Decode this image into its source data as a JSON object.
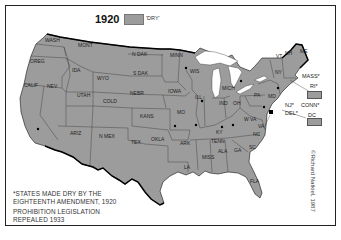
{
  "map": {
    "title": "1920",
    "legend": {
      "label": "'DRY'",
      "color": "#9c9c9c"
    },
    "land_color": "#9c9c9c",
    "water_color": "#ffffff",
    "states": [
      {
        "abbr": "WASH",
        "x": 45,
        "y": 42
      },
      {
        "abbr": "OREG",
        "x": 30,
        "y": 63
      },
      {
        "abbr": "CALIF",
        "x": 24,
        "y": 87
      },
      {
        "abbr": "NEV",
        "x": 47,
        "y": 88
      },
      {
        "abbr": "IDA",
        "x": 72,
        "y": 72
      },
      {
        "abbr": "MONT",
        "x": 78,
        "y": 47
      },
      {
        "abbr": "WYO",
        "x": 97,
        "y": 80
      },
      {
        "abbr": "UTAH",
        "x": 77,
        "y": 97
      },
      {
        "abbr": "COLD",
        "x": 103,
        "y": 103
      },
      {
        "abbr": "ARIZ",
        "x": 70,
        "y": 135
      },
      {
        "abbr": "N MEX",
        "x": 99,
        "y": 138
      },
      {
        "abbr": "N DAK",
        "x": 132,
        "y": 56
      },
      {
        "abbr": "S DAK",
        "x": 133,
        "y": 75
      },
      {
        "abbr": "NEBR",
        "x": 130,
        "y": 95
      },
      {
        "abbr": "KANS",
        "x": 140,
        "y": 118
      },
      {
        "abbr": "OKLA",
        "x": 151,
        "y": 141
      },
      {
        "abbr": "TEX",
        "x": 131,
        "y": 144
      },
      {
        "abbr": "MINN",
        "x": 170,
        "y": 57
      },
      {
        "abbr": "IOWA",
        "x": 168,
        "y": 93
      },
      {
        "abbr": "MO",
        "x": 177,
        "y": 114
      },
      {
        "abbr": "ARK",
        "x": 180,
        "y": 145
      },
      {
        "abbr": "LA",
        "x": 184,
        "y": 169
      },
      {
        "abbr": "WIS",
        "x": 190,
        "y": 73
      },
      {
        "abbr": "ILL",
        "x": 195,
        "y": 99
      },
      {
        "abbr": "MICH",
        "x": 222,
        "y": 90
      },
      {
        "abbr": "IND",
        "x": 219,
        "y": 105
      },
      {
        "abbr": "OH",
        "x": 233,
        "y": 105
      },
      {
        "abbr": "KY",
        "x": 216,
        "y": 134
      },
      {
        "abbr": "TENN",
        "x": 211,
        "y": 143
      },
      {
        "abbr": "MISS",
        "x": 202,
        "y": 159
      },
      {
        "abbr": "ALA",
        "x": 218,
        "y": 153
      },
      {
        "abbr": "GA",
        "x": 234,
        "y": 152
      },
      {
        "abbr": "FLA",
        "x": 250,
        "y": 183
      },
      {
        "abbr": "SC",
        "x": 249,
        "y": 149
      },
      {
        "abbr": "NC",
        "x": 253,
        "y": 136
      },
      {
        "abbr": "VA",
        "x": 258,
        "y": 128
      },
      {
        "abbr": "W VA",
        "x": 244,
        "y": 121
      },
      {
        "abbr": "PA",
        "x": 254,
        "y": 97
      },
      {
        "abbr": "MD",
        "x": 268,
        "y": 98
      },
      {
        "abbr": "NY",
        "x": 275,
        "y": 74
      },
      {
        "abbr": "ME",
        "x": 300,
        "y": 53
      },
      {
        "abbr": "VT",
        "x": 276,
        "y": 58
      },
      {
        "abbr": "NH",
        "x": 285,
        "y": 55
      }
    ],
    "dry_markers": [
      {
        "x": 38,
        "y": 129
      },
      {
        "x": 186,
        "y": 68
      },
      {
        "x": 202,
        "y": 101
      },
      {
        "x": 196,
        "y": 125
      },
      {
        "x": 175,
        "y": 126
      },
      {
        "x": 222,
        "y": 127
      },
      {
        "x": 241,
        "y": 81
      },
      {
        "x": 278,
        "y": 88
      },
      {
        "x": 264,
        "y": 107
      },
      {
        "x": 233,
        "y": 125
      }
    ],
    "side_labels": [
      {
        "text": "MASS*",
        "x": 302,
        "y": 73
      },
      {
        "text": "RI*",
        "x": 310,
        "y": 83
      },
      {
        "text": "NJ*",
        "x": 285,
        "y": 102
      },
      {
        "text": "CONN*",
        "x": 301,
        "y": 102
      },
      {
        "text": "DEL*",
        "x": 285,
        "y": 110
      },
      {
        "text": "DC",
        "x": 308,
        "y": 112
      }
    ],
    "footnote": {
      "line1": "*STATES MADE DRY BY THE",
      "line2": "EIGHTEENTH AMENDMENT, 1920",
      "line3": "PROHIBITION LEGISLATION",
      "line4": "REPEALED 1933"
    },
    "credit": "©Richard Natkiel, 1987"
  }
}
